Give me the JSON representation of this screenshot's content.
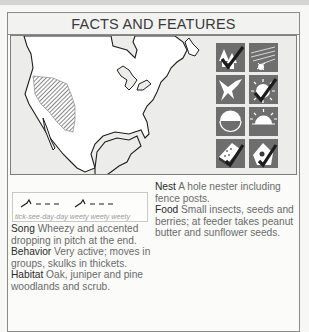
{
  "header": {
    "title": "FACTS AND FEATURES"
  },
  "map": {
    "description": "North America outline map with hatched range area in the western interior",
    "range_fill_color": "#7a7a7a",
    "ocean_color": "#ececea",
    "land_color": "#ffffff"
  },
  "icons": [
    {
      "name": "forest-habitat-icon",
      "checked": true
    },
    {
      "name": "flight-burst-icon",
      "checked": false
    },
    {
      "name": "bird-flying-icon",
      "checked": false
    },
    {
      "name": "sun-daytime-icon",
      "checked": true
    },
    {
      "name": "half-circle-icon",
      "checked": false
    },
    {
      "name": "sunrise-icon",
      "checked": false
    },
    {
      "name": "feeder-seed-icon",
      "checked": true
    },
    {
      "name": "birdhouse-icon",
      "checked": true
    }
  ],
  "song": {
    "caption": "tick-see-day-day weety weety weety"
  },
  "facts": {
    "song_label": "Song",
    "song_text": " Wheezy and accented dropping in pitch at the end.",
    "behavior_label": "Behavior",
    "behavior_text": " Very active; moves in groups, skulks in thickets.",
    "habitat_label": "Habitat",
    "habitat_text": " Oak, juniper and pine woodlands and scrub.",
    "nest_label": "Nest",
    "nest_text": " A hole nester including fence posts.",
    "food_label": "Food",
    "food_text": " Small insects, seeds and berries; at feeder takes peanut butter and sunflower seeds."
  }
}
